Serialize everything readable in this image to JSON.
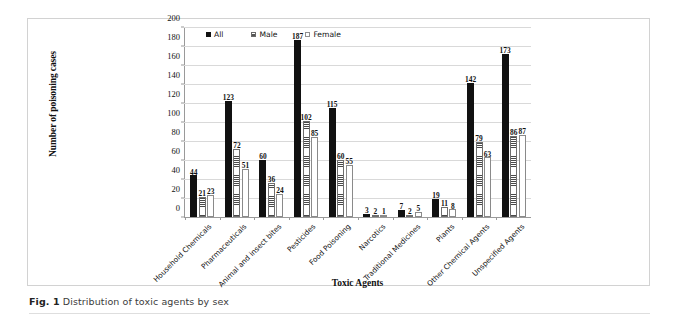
{
  "figure": {
    "caption_label": "Fig. 1",
    "caption_text": "Distribution of toxic agents by sex"
  },
  "legend": {
    "position": "top-center",
    "items": [
      {
        "label": "All",
        "swatch": "black-filled"
      },
      {
        "label": "Male",
        "swatch": "horizontal-hatch"
      },
      {
        "label": "Female",
        "swatch": "white-outline"
      }
    ]
  },
  "chart_data": {
    "type": "bar",
    "title": "",
    "xlabel": "Toxic Agents",
    "ylabel": "Number of poisoning cases",
    "ylim": [
      0,
      200
    ],
    "yticks": [
      0,
      20,
      40,
      60,
      80,
      100,
      120,
      140,
      160,
      180,
      200
    ],
    "grid": true,
    "legend_position": "top-center",
    "categories": [
      "Household Chemicals",
      "Pharmaceuticals",
      "Animal and insect bites",
      "Pesticides",
      "Food Poisoning",
      "Narcotics",
      "Traditional Medicines",
      "Plants",
      "Other Chemical Agents",
      "Unspecified Agents"
    ],
    "series": [
      {
        "name": "All",
        "values": [
          44,
          123,
          60,
          187,
          115,
          3,
          7,
          19,
          142,
          173
        ]
      },
      {
        "name": "Male",
        "values": [
          21,
          72,
          36,
          102,
          60,
          2,
          2,
          11,
          79,
          86
        ]
      },
      {
        "name": "Female",
        "values": [
          23,
          51,
          24,
          85,
          55,
          1,
          5,
          8,
          63,
          87
        ]
      }
    ]
  }
}
